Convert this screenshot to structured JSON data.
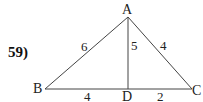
{
  "problem": {
    "number": "59)"
  },
  "vertices": {
    "A": {
      "label": "A"
    },
    "B": {
      "label": "B"
    },
    "C": {
      "label": "C"
    },
    "D": {
      "label": "D"
    }
  },
  "segments": {
    "AB": {
      "length": "6"
    },
    "AD": {
      "length": "5"
    },
    "AC": {
      "length": "4"
    },
    "BD": {
      "length": "4"
    },
    "DC": {
      "length": "2"
    }
  },
  "colors": {
    "line": "#444444",
    "text": "#222222",
    "background": "#ffffff"
  }
}
